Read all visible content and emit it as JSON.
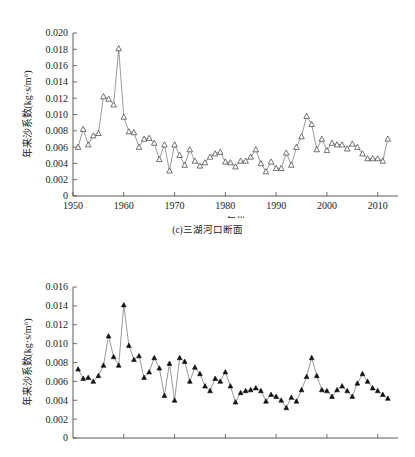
{
  "figure": {
    "caption_c": "(c)三湖河口断面"
  },
  "chart_data": [
    {
      "id": "panel-top",
      "type": "line",
      "title": "",
      "subtitle": "",
      "caption": "(c)三湖河口断面",
      "xlabel": "年份",
      "ylabel": "年来沙系数(kg·s/m⁶)",
      "marker": "open-triangle",
      "grid": false,
      "legend": "none",
      "xlim": [
        1950,
        2014
      ],
      "ylim": [
        0,
        0.02
      ],
      "xticks": [
        1950,
        1960,
        1970,
        1980,
        1990,
        2000,
        2010
      ],
      "xtick_labels": [
        "1950",
        "1960",
        "1970",
        "1980",
        "1990",
        "2000",
        "2010"
      ],
      "yticks": [
        0,
        0.002,
        0.004,
        0.006,
        0.008,
        0.01,
        0.012,
        0.014,
        0.016,
        0.018,
        0.02
      ],
      "ytick_labels": [
        "0",
        "0.002",
        "0.004",
        "0.006",
        "0.008",
        "0.010",
        "0.012",
        "0.014",
        "0.016",
        "0.018",
        "0.020"
      ],
      "x": [
        1951,
        1952,
        1953,
        1954,
        1955,
        1956,
        1957,
        1958,
        1959,
        1960,
        1961,
        1962,
        1963,
        1964,
        1965,
        1966,
        1967,
        1968,
        1969,
        1970,
        1971,
        1972,
        1973,
        1974,
        1975,
        1976,
        1977,
        1978,
        1979,
        1980,
        1981,
        1982,
        1983,
        1984,
        1985,
        1986,
        1987,
        1988,
        1989,
        1990,
        1991,
        1992,
        1993,
        1994,
        1995,
        1996,
        1997,
        1998,
        1999,
        2000,
        2001,
        2002,
        2003,
        2004,
        2005,
        2006,
        2007,
        2008,
        2009,
        2010,
        2011,
        2012
      ],
      "y": [
        0.006,
        0.0082,
        0.0063,
        0.0074,
        0.0077,
        0.0122,
        0.0119,
        0.0112,
        0.0181,
        0.0097,
        0.0079,
        0.0078,
        0.006,
        0.007,
        0.0071,
        0.0065,
        0.0045,
        0.0063,
        0.0031,
        0.0063,
        0.005,
        0.0038,
        0.0057,
        0.0043,
        0.0037,
        0.0041,
        0.0048,
        0.0052,
        0.0054,
        0.0042,
        0.0041,
        0.0036,
        0.0043,
        0.0043,
        0.0048,
        0.0057,
        0.004,
        0.003,
        0.0042,
        0.0034,
        0.0034,
        0.0053,
        0.0038,
        0.006,
        0.0073,
        0.0098,
        0.0088,
        0.0057,
        0.007,
        0.0056,
        0.0065,
        0.0063,
        0.0063,
        0.0058,
        0.0064,
        0.006,
        0.0052,
        0.0046,
        0.0046,
        0.0046,
        0.0043,
        0.007
      ]
    },
    {
      "id": "panel-bottom",
      "type": "line",
      "title": "",
      "subtitle": "",
      "caption": "",
      "xlabel": "",
      "ylabel": "年来沙系数(kg·s/m⁶)",
      "marker": "filled-triangle",
      "grid": false,
      "legend": "none",
      "xlim": [
        1950,
        2014
      ],
      "ylim": [
        0,
        0.016
      ],
      "xticks": [
        1960,
        1970,
        1980,
        1990,
        2000,
        2010
      ],
      "xtick_labels": [
        "",
        "",
        "",
        "",
        "",
        ""
      ],
      "yticks": [
        0,
        0.002,
        0.004,
        0.006,
        0.008,
        0.01,
        0.012,
        0.014,
        0.016
      ],
      "ytick_labels": [
        "0",
        "0.002",
        "0.004",
        "0.006",
        "0.008",
        "0.010",
        "0.012",
        "0.014",
        "0.016"
      ],
      "x": [
        1951,
        1952,
        1953,
        1954,
        1955,
        1956,
        1957,
        1958,
        1959,
        1960,
        1961,
        1962,
        1963,
        1964,
        1965,
        1966,
        1967,
        1968,
        1969,
        1970,
        1971,
        1972,
        1973,
        1974,
        1975,
        1976,
        1977,
        1978,
        1979,
        1980,
        1981,
        1982,
        1983,
        1984,
        1985,
        1986,
        1987,
        1988,
        1989,
        1990,
        1991,
        1992,
        1993,
        1994,
        1995,
        1996,
        1997,
        1998,
        1999,
        2000,
        2001,
        2002,
        2003,
        2004,
        2005,
        2006,
        2007,
        2008,
        2009,
        2010,
        2011,
        2012
      ],
      "y": [
        0.0073,
        0.0063,
        0.0064,
        0.006,
        0.0066,
        0.0077,
        0.0108,
        0.0086,
        0.0077,
        0.0141,
        0.0098,
        0.0083,
        0.0087,
        0.0064,
        0.007,
        0.0085,
        0.0074,
        0.0045,
        0.0079,
        0.004,
        0.0085,
        0.0081,
        0.006,
        0.0075,
        0.0068,
        0.0055,
        0.005,
        0.0063,
        0.006,
        0.007,
        0.0055,
        0.0038,
        0.0048,
        0.005,
        0.0051,
        0.0053,
        0.005,
        0.0039,
        0.0046,
        0.0044,
        0.004,
        0.0032,
        0.0043,
        0.0039,
        0.0051,
        0.0065,
        0.0085,
        0.0066,
        0.0051,
        0.005,
        0.0044,
        0.0051,
        0.0055,
        0.005,
        0.0044,
        0.0058,
        0.0068,
        0.006,
        0.0053,
        0.005,
        0.0046,
        0.0042
      ]
    }
  ]
}
